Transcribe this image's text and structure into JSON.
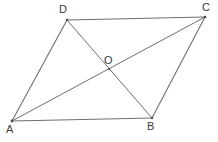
{
  "figure": {
    "type": "geometry-diagram",
    "shape_name": "parallelogram",
    "background_color": "#ffffff",
    "stroke_color": "#6f6f72",
    "label_color": "#3a3a3a",
    "stroke_width": 1,
    "canvas": {
      "width": 218,
      "height": 142
    },
    "points": [
      {
        "id": "A",
        "label": "A",
        "x": 12,
        "y": 121,
        "label_x": 6,
        "label_y": 124
      },
      {
        "id": "B",
        "label": "B",
        "x": 152,
        "y": 118,
        "label_x": 147,
        "label_y": 121
      },
      {
        "id": "C",
        "label": "C",
        "x": 205,
        "y": 17,
        "label_x": 202,
        "label_y": 2
      },
      {
        "id": "D",
        "label": "D",
        "x": 67,
        "y": 20,
        "label_x": 59,
        "label_y": 4
      },
      {
        "id": "O",
        "label": "O",
        "x": 109,
        "y": 69,
        "label_x": 104,
        "label_y": 55
      }
    ],
    "segments": [
      {
        "name": "side-AB",
        "from": "A",
        "to": "B"
      },
      {
        "name": "side-BC",
        "from": "B",
        "to": "C"
      },
      {
        "name": "side-CD",
        "from": "C",
        "to": "D"
      },
      {
        "name": "side-DA",
        "from": "D",
        "to": "A"
      },
      {
        "name": "diagonal-AC",
        "from": "A",
        "to": "C"
      },
      {
        "name": "diagonal-BD",
        "from": "B",
        "to": "D"
      }
    ]
  }
}
